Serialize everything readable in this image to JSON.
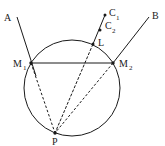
{
  "diagram": {
    "labels": {
      "A": "A",
      "B": "B",
      "C1": "C",
      "C1_sub": "1",
      "C2": "C",
      "C2_sub": "2",
      "L": "L",
      "M1": "M",
      "M1_sub": "1",
      "M2": "M",
      "M2_sub": "2",
      "P": "P"
    },
    "points": {
      "A_end": [
        17,
        17
      ],
      "B_end": [
        149,
        17
      ],
      "C1": [
        105,
        15
      ],
      "C2": [
        100,
        30
      ],
      "L": [
        93,
        44
      ],
      "M1": [
        31,
        63
      ],
      "M2": [
        113,
        63
      ],
      "P": [
        55,
        133
      ]
    },
    "circle": {
      "cx": 72,
      "cy": 88,
      "r": 48
    },
    "colors": {
      "stroke": "#1a1a1a",
      "background": "#ffffff"
    }
  }
}
